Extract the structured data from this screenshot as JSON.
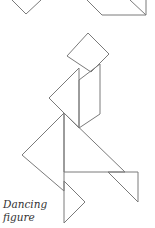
{
  "caption": {
    "line1": "Dancing",
    "line2": "figure"
  },
  "colors": {
    "stroke": "#7a7a7a",
    "text": "#333333",
    "background": "#ffffff"
  }
}
